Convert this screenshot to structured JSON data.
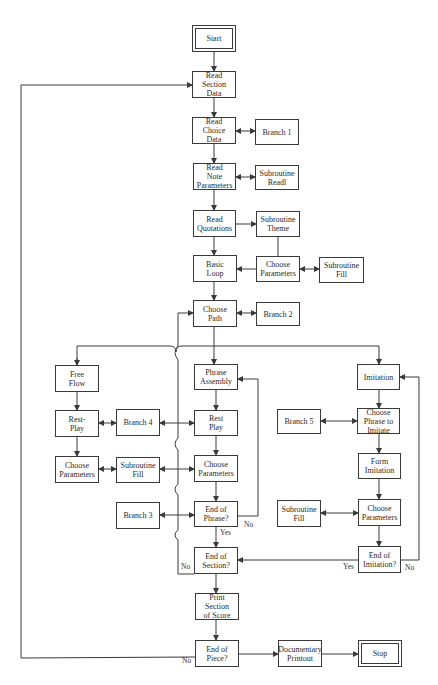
{
  "diagram": {
    "type": "flowchart",
    "nodes": {
      "start": "Start",
      "read_section_data": "Read\nSection\nData",
      "read_choice_data": "Read\nChoice\nData",
      "branch1": "Branch 1",
      "read_note_parameters": "Read\nNote\nParameters",
      "subroutine_readl": "Subroutine\nReadl",
      "read_quotations": "Read\nQuotations",
      "subroutine_theme": "Subroutine\nTheme",
      "basic_loop": "Basic\nLoop",
      "choose_parameters_top": "Choose\nParameters",
      "subroutine_fill_top": "Subroutine\nFill",
      "choose_path": "Choose\nPath",
      "branch2": "Branch 2",
      "free_flow": "Free\nFlow",
      "phrase_assembly": "Phrase\nAssembly",
      "imitation": "Imitation",
      "rest_play_left": "Rest-\nPlay",
      "branch4": "Branch 4",
      "rest_play_center": "Rest\nPlay",
      "branch5": "Branch 5",
      "choose_phrase_to_imitate": "Choose\nPhrase to\nImitate",
      "choose_parameters_left": "Choose\nParameters",
      "subroutine_fill_left": "Subroutine\nFill",
      "choose_parameters_center": "Choose\nParameters",
      "form_imitation": "Form\nImitation",
      "branch3": "Branch 3",
      "end_of_phrase": "End of\nPhrase?",
      "subroutine_fill_right": "Subroutine\nFill",
      "choose_parameters_right": "Choose\nParameters",
      "end_of_section": "End of\nSection?",
      "end_of_imitation": "End of\nImitation?",
      "print_section_of_score": "Print\nSection\nof Score",
      "end_of_piece": "End of\nPiece?",
      "documentary_printout": "Documentary\nPrintout",
      "stop": "Stop"
    },
    "edge_labels": {
      "phrase_no": "No",
      "phrase_yes": "Yes",
      "section_no": "No",
      "imitation_yes": "Yes",
      "imitation_no": "No",
      "piece_no": "No"
    }
  }
}
